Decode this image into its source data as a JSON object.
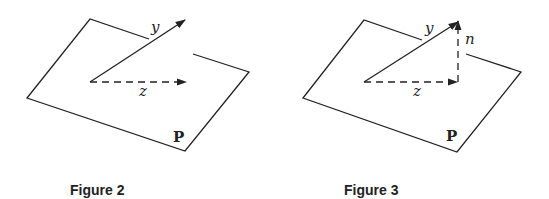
{
  "figures": [
    {
      "id": "figure-2",
      "caption": "Figure 2",
      "plane_label": "P",
      "vectors": [
        {
          "name": "y",
          "style": "solid",
          "label": "y"
        },
        {
          "name": "z",
          "style": "dashed",
          "label": "z"
        }
      ]
    },
    {
      "id": "figure-3",
      "caption": "Figure 3",
      "plane_label": "P",
      "vectors": [
        {
          "name": "y",
          "style": "solid",
          "label": "y"
        },
        {
          "name": "z",
          "style": "dashed",
          "label": "z"
        },
        {
          "name": "n",
          "style": "dashed",
          "label": "n"
        }
      ]
    }
  ],
  "colors": {
    "stroke": "#222222",
    "background": "#ffffff"
  }
}
